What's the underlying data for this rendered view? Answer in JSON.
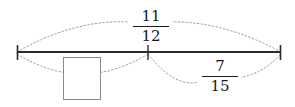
{
  "figure": {
    "type": "number-line-fraction-diagram",
    "colors": {
      "line": "#2b2b2b",
      "arc": "#9a9a9a",
      "box_border": "#8a8a8a",
      "text": "#1a1a1a",
      "background": "#ffffff"
    },
    "number_line": {
      "start_x": 17,
      "end_x": 281,
      "y": 52,
      "tick_marks": [
        {
          "name": "left-endpoint",
          "x": 17
        },
        {
          "name": "midpoint",
          "x": 148
        },
        {
          "name": "right-endpoint",
          "x": 281
        }
      ]
    },
    "arcs": [
      {
        "name": "total-arc",
        "position": "above",
        "from_x": 17,
        "to_x": 281,
        "label": "11/12",
        "style": "dotted"
      },
      {
        "name": "left-segment-arc",
        "position": "below",
        "from_x": 17,
        "to_x": 148,
        "label": "",
        "style": "dotted"
      },
      {
        "name": "right-segment-arc",
        "position": "below",
        "from_x": 148,
        "to_x": 281,
        "label": "7/15",
        "style": "dotted"
      }
    ],
    "labels": {
      "total": {
        "numerator": "11",
        "denominator": "12",
        "position": "above-center"
      },
      "right_segment": {
        "numerator": "7",
        "denominator": "15",
        "position": "below-right"
      }
    },
    "answer_box": {
      "label": "",
      "placeholder": "",
      "position": "below-left"
    }
  }
}
